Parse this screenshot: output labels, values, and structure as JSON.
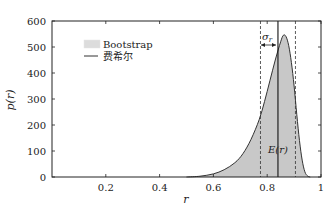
{
  "chart_data": {
    "type": "area",
    "title": "",
    "xlabel": "r",
    "ylabel": "p(r)",
    "xlim": [
      0,
      1
    ],
    "ylim": [
      0,
      600
    ],
    "xticks": [
      0.2,
      0.4,
      0.6,
      0.8,
      1
    ],
    "xtick_labels": [
      "0.2",
      "0.4",
      "0.6",
      "0.8",
      "1"
    ],
    "yticks": [
      0,
      100,
      200,
      300,
      400,
      500,
      600
    ],
    "ytick_labels": [
      "0",
      "100",
      "200",
      "300",
      "400",
      "500",
      "600"
    ],
    "grid": false,
    "legend_position": "upper-left",
    "series": [
      {
        "name": "Bootstrap",
        "kind": "filled-histogram",
        "color": "#c8c8c8",
        "x": [
          0.5,
          0.55,
          0.6,
          0.64,
          0.68,
          0.71,
          0.74,
          0.77,
          0.79,
          0.81,
          0.83,
          0.85,
          0.86,
          0.87,
          0.88,
          0.89,
          0.9,
          0.91,
          0.92,
          0.93,
          0.94,
          0.95,
          0.96
        ],
        "values": [
          0,
          3,
          12,
          28,
          55,
          90,
          145,
          220,
          290,
          370,
          450,
          520,
          545,
          540,
          505,
          440,
          350,
          240,
          140,
          65,
          20,
          4,
          0
        ]
      },
      {
        "name": "费希尔",
        "kind": "line",
        "color": "#333333",
        "x": [
          0.5,
          0.55,
          0.6,
          0.64,
          0.68,
          0.71,
          0.74,
          0.77,
          0.79,
          0.81,
          0.83,
          0.85,
          0.86,
          0.87,
          0.88,
          0.89,
          0.9,
          0.91,
          0.92,
          0.93,
          0.94,
          0.95,
          0.96
        ],
        "values": [
          0,
          3,
          12,
          28,
          55,
          90,
          145,
          220,
          290,
          370,
          450,
          520,
          545,
          540,
          505,
          440,
          350,
          240,
          140,
          65,
          20,
          4,
          0
        ]
      }
    ],
    "annotations": [
      {
        "type": "vline-solid",
        "x": 0.84,
        "label": "E(r)"
      },
      {
        "type": "vline-dashed",
        "x": 0.775
      },
      {
        "type": "vline-dashed",
        "x": 0.905
      },
      {
        "type": "arrow",
        "from": 0.775,
        "to": 0.84,
        "y": 505,
        "label": "σr"
      }
    ]
  },
  "legend": {
    "items": [
      {
        "label": "Bootstrap",
        "swatch": "fill"
      },
      {
        "label": "费希尔",
        "swatch": "line"
      }
    ]
  },
  "annotations": {
    "mean_label": "E(r)",
    "sigma_label": "σ",
    "sigma_sub": "r"
  },
  "axes": {
    "xlabel": "r",
    "ylabel": "p(r)"
  }
}
